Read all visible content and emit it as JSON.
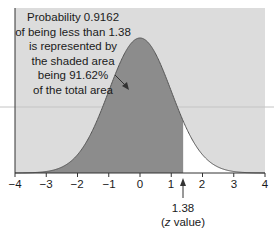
{
  "chart_data": {
    "type": "area",
    "title": "",
    "xlabel": "",
    "ylabel": "",
    "distribution": "standard normal",
    "x_ticks": [
      -4,
      -3,
      -2,
      -1,
      0,
      1,
      2,
      3,
      4
    ],
    "x_tick_labels": [
      "−4",
      "−3",
      "−2",
      "−1",
      "0",
      "1",
      "2",
      "3",
      "4"
    ],
    "xlim": [
      -4,
      4
    ],
    "grid": false,
    "shaded_region": {
      "from": -4,
      "to": 1.38,
      "area": 0.9162
    },
    "annotations": [
      "Probability 0.9162 of being less than 1.38 is represented by the shaded area being 91.62% of the total area",
      "1.38 (z value)"
    ],
    "colors": {
      "background": "#dcdcdc",
      "shaded": "#8c8c8c",
      "unshaded_tail": "#ffffff",
      "curve": "#555555"
    }
  },
  "annotation": {
    "lines": [
      "Probability 0.9162",
      "of being less than 1.38",
      "is represented by",
      "the shaded area",
      "being 91.62%",
      "of the total area"
    ]
  },
  "axis": {
    "ticks": [
      "−4",
      "−3",
      "−2",
      "−1",
      "0",
      "1",
      "2",
      "3",
      "4"
    ]
  },
  "marker": {
    "value": "1.38",
    "label_prefix": "(",
    "label_var": "z",
    "label_suffix": " value)"
  }
}
